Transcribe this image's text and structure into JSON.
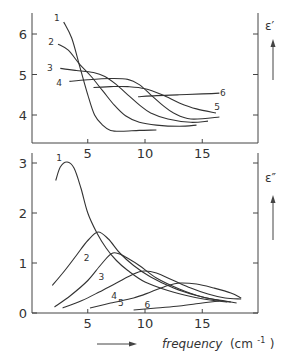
{
  "figure": {
    "xlabel": "frequency",
    "xunit_open": "(cm",
    "xunit_exp": "-1",
    "xunit_close": ")"
  },
  "chart_data": [
    {
      "type": "line",
      "title": "",
      "ylabel": "ε′",
      "xlabel": "frequency (cm⁻¹)",
      "xlim": [
        0,
        20
      ],
      "ylim": [
        3.3,
        6.5
      ],
      "x_ticks": [
        5,
        10,
        15
      ],
      "y_ticks": [
        4,
        5,
        6
      ],
      "y_tick_labels": [
        "4",
        "5",
        "6"
      ],
      "x_tick_labels": [
        "5",
        "10",
        "15"
      ],
      "grid": false,
      "legend": "curve numbers labelled directly (1–6)",
      "series": [
        {
          "name": "1",
          "label_pos": [
            2.3,
            6.4
          ],
          "x": [
            2.9,
            3.6,
            4.3,
            5.0,
            5.6,
            6.3,
            7.0,
            8.0,
            9.5,
            11.0
          ],
          "y": [
            6.3,
            5.9,
            5.2,
            4.5,
            4.0,
            3.75,
            3.62,
            3.6,
            3.62,
            3.63
          ]
        },
        {
          "name": "2",
          "label_pos": [
            1.8,
            5.8
          ],
          "x": [
            2.4,
            3.3,
            4.3,
            5.3,
            6.3,
            7.3,
            8.3,
            9.5,
            11.0,
            13.0,
            14.5
          ],
          "y": [
            5.75,
            5.6,
            5.25,
            4.95,
            4.6,
            4.25,
            3.98,
            3.82,
            3.75,
            3.72,
            3.75
          ]
        },
        {
          "name": "3",
          "label_pos": [
            1.7,
            5.15
          ],
          "x": [
            2.6,
            4.0,
            5.5,
            6.5,
            7.5,
            8.5,
            9.5,
            10.5,
            12.0,
            14.0,
            15.5
          ],
          "y": [
            5.15,
            5.1,
            5.05,
            4.95,
            4.75,
            4.5,
            4.25,
            4.05,
            3.9,
            3.82,
            3.85
          ]
        },
        {
          "name": "4",
          "label_pos": [
            2.5,
            4.78
          ],
          "x": [
            3.4,
            5.0,
            7.0,
            8.5,
            9.5,
            10.5,
            11.5,
            12.5,
            14.0,
            16.5
          ],
          "y": [
            4.83,
            4.87,
            4.9,
            4.88,
            4.75,
            4.5,
            4.25,
            4.05,
            3.9,
            3.95
          ]
        },
        {
          "name": "5",
          "label_pos": [
            16.3,
            4.2
          ],
          "x": [
            5.5,
            7.0,
            8.5,
            10.0,
            11.5,
            13.0,
            14.5,
            16.2
          ],
          "y": [
            4.68,
            4.7,
            4.7,
            4.65,
            4.5,
            4.3,
            4.15,
            4.05
          ]
        },
        {
          "name": "6",
          "label_pos": [
            16.8,
            4.55
          ],
          "x": [
            9.4,
            11.0,
            13.0,
            15.0,
            16.5
          ],
          "y": [
            4.45,
            4.48,
            4.5,
            4.52,
            4.54
          ]
        }
      ]
    },
    {
      "type": "line",
      "title": "",
      "ylabel": "ε″",
      "xlabel": "frequency (cm⁻¹)",
      "xlim": [
        0,
        20
      ],
      "ylim": [
        0,
        3.3
      ],
      "x_ticks": [
        5,
        10,
        15
      ],
      "y_ticks": [
        0,
        1,
        2,
        3
      ],
      "y_tick_labels": [
        "0",
        "1",
        "2",
        "3"
      ],
      "x_tick_labels": [
        "5",
        "10",
        "15"
      ],
      "grid": false,
      "legend": "curve numbers labelled directly (1–6)",
      "series": [
        {
          "name": "1",
          "peak": [
            3.2,
            3.02
          ],
          "label_pos": [
            2.5,
            3.1
          ],
          "x": [
            2.2,
            2.6,
            3.2,
            3.8,
            4.4,
            5.0,
            5.8,
            6.6,
            7.5,
            8.5,
            10.0,
            12.0,
            14.0,
            16.0,
            17.2
          ],
          "y": [
            2.65,
            2.92,
            3.02,
            2.9,
            2.5,
            2.0,
            1.6,
            1.3,
            1.05,
            0.85,
            0.62,
            0.45,
            0.33,
            0.25,
            0.22
          ]
        },
        {
          "name": "2",
          "peak": [
            5.9,
            1.62
          ],
          "label_pos": [
            4.9,
            1.1
          ],
          "x": [
            1.9,
            3.0,
            4.0,
            5.0,
            5.9,
            6.8,
            7.8,
            9.0,
            10.5,
            12.5,
            14.5,
            16.5,
            17.5
          ],
          "y": [
            0.55,
            0.85,
            1.15,
            1.45,
            1.62,
            1.48,
            1.2,
            0.95,
            0.72,
            0.5,
            0.35,
            0.25,
            0.22
          ]
        },
        {
          "name": "3",
          "peak": [
            7.2,
            1.2
          ],
          "label_pos": [
            6.2,
            0.72
          ],
          "x": [
            2.1,
            3.5,
            5.0,
            6.2,
            7.2,
            8.3,
            9.5,
            11.0,
            13.0,
            15.0,
            17.0,
            18.0
          ],
          "y": [
            0.12,
            0.35,
            0.65,
            0.98,
            1.2,
            1.12,
            0.95,
            0.7,
            0.48,
            0.32,
            0.24,
            0.2
          ]
        },
        {
          "name": "4",
          "peak": [
            9.9,
            0.84
          ],
          "label_pos": [
            7.3,
            0.35
          ],
          "x": [
            2.8,
            4.5,
            6.0,
            7.5,
            9.0,
            9.9,
            11.0,
            12.5,
            14.0,
            15.5,
            17.0,
            18.4
          ],
          "y": [
            0.1,
            0.25,
            0.42,
            0.6,
            0.78,
            0.84,
            0.8,
            0.65,
            0.5,
            0.38,
            0.3,
            0.28
          ]
        },
        {
          "name": "5",
          "peak": [
            13.0,
            0.6
          ],
          "label_pos": [
            7.9,
            0.2
          ],
          "x": [
            5.2,
            7.0,
            9.0,
            10.5,
            12.0,
            13.0,
            14.5,
            16.0,
            17.5,
            18.4
          ],
          "y": [
            0.1,
            0.2,
            0.3,
            0.42,
            0.55,
            0.6,
            0.58,
            0.5,
            0.4,
            0.3
          ]
        },
        {
          "name": "6",
          "label_pos": [
            10.2,
            0.16
          ],
          "x": [
            9.0,
            11.0,
            13.0,
            15.0,
            16.5
          ],
          "y": [
            0.06,
            0.1,
            0.14,
            0.2,
            0.24
          ]
        }
      ]
    }
  ]
}
